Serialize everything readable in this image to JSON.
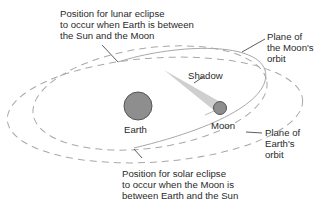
{
  "diagram": {
    "labels": {
      "lunar_eclipse": "Position for lunar eclipse\nto occur when Earth is between\nthe Sun and the Moon",
      "moon_orbit_plane": "Plane of\nthe Moon's\norbit",
      "shadow": "Shadow",
      "earth": "Earth",
      "moon": "Moon",
      "earth_orbit_plane": "Plane of\nEarth's\norbit",
      "solar_eclipse": "Position for solar eclipse\nto occur when the Moon is\nbetween Earth and the Sun"
    },
    "colors": {
      "orbit_line": "#a8a8a8",
      "leader_line": "#333333",
      "earth_fill": "#8e8e8e",
      "moon_fill": "#8e8e8e",
      "body_stroke": "#555555",
      "shadow": "#cfcfcf",
      "text": "#2a2a2a"
    }
  }
}
